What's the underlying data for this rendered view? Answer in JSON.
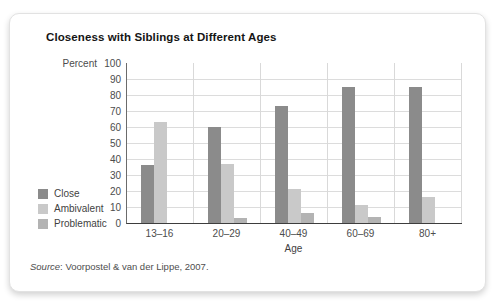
{
  "card": {
    "title": "Closeness with Siblings at Different Ages",
    "source_label": "Source",
    "source_rest": ": Voorpostel & van der Lippe, 2007."
  },
  "chart_data": {
    "type": "bar",
    "title": "Closeness with Siblings at Different Ages",
    "categories": [
      "13–16",
      "20–29",
      "40–49",
      "60–69",
      "80+"
    ],
    "series": [
      {
        "name": "Close",
        "color": "#8b8b8b",
        "values": [
          36,
          60,
          73,
          85,
          85
        ]
      },
      {
        "name": "Ambivalent",
        "color": "#c9c9c9",
        "values": [
          63,
          37,
          21,
          11,
          16
        ]
      },
      {
        "name": "Problematic",
        "color": "#b3b3b3",
        "values": [
          0,
          3,
          6,
          4,
          0
        ]
      }
    ],
    "xlabel": "Age",
    "ylabel": "Percent",
    "ylim": [
      0,
      100
    ],
    "ytick_step": 10,
    "grid": true,
    "legend_position": "left",
    "source": "Source: Voorpostel & van der Lippe, 2007."
  }
}
